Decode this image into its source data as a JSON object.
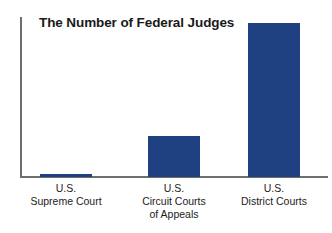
{
  "chart_data": {
    "type": "bar",
    "title": "The Number of Federal Judges",
    "xlabel": "",
    "ylabel": "",
    "grid": false,
    "legend": false,
    "ylim": [
      0,
      700
    ],
    "categories": [
      "U.S. Supreme Court",
      "U.S. Circuit Courts of Appeals",
      "U.S. District Courts"
    ],
    "category_lines": [
      [
        "U.S.",
        "Supreme Court"
      ],
      [
        "U.S.",
        "Circuit Courts",
        "of Appeals"
      ],
      [
        "U.S.",
        "District Courts"
      ]
    ],
    "values": [
      9,
      179,
      677
    ],
    "bar_color": "#1f4181",
    "axis_color": "#6e6e6e",
    "title_color": "#1a1a1a",
    "background_color": "#ffffff"
  }
}
